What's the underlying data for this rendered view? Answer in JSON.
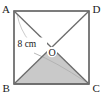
{
  "figure": {
    "type": "geometry-diagram",
    "shape": "square",
    "vertices": [
      {
        "name": "vertex-a",
        "label": "A",
        "position": "top-left",
        "x": 14,
        "y": 11
      },
      {
        "name": "vertex-d",
        "label": "D",
        "position": "top-right",
        "x": 89,
        "y": 11
      },
      {
        "name": "vertex-b",
        "label": "B",
        "position": "bottom-left",
        "x": 14,
        "y": 84
      },
      {
        "name": "vertex-c",
        "label": "C",
        "position": "bottom-right",
        "x": 89,
        "y": 84
      }
    ],
    "centre": {
      "name": "centre-o",
      "label": "O",
      "x": 51.5,
      "y": 47.5
    },
    "measurement": {
      "label": "8 cm",
      "value": 8,
      "unit": "cm",
      "applies_to": "diagonal AC",
      "label_x": 32,
      "label_y": 45
    },
    "shaded_region": {
      "name": "triangle-boc",
      "vertices": "B, O, C",
      "fill": "#c9c9c9",
      "stroke": "#6e6e6e"
    },
    "colors": {
      "outline": "#5c5c5c",
      "diagonal": "#6b6b6b",
      "shade_fill": "#c9c9c9",
      "leader_arc": "#bdbdbd",
      "text": "#1a1a1a",
      "background": "#ffffff"
    },
    "labels": {
      "a": "A",
      "b": "B",
      "c": "C",
      "d": "D",
      "o": "O",
      "measure": "8 cm"
    }
  }
}
